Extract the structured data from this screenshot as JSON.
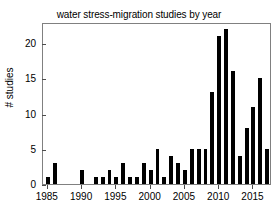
{
  "chart_data": {
    "type": "bar",
    "title": "water stress-migration studies by year",
    "xlabel": "",
    "ylabel": "# studies",
    "xlim": [
      1984.3,
      11
    ],
    "ylim": [
      0,
      23
    ],
    "grid": false,
    "legend": null,
    "bar_color": "#000000",
    "axis_color": "#808080",
    "categories": [
      1985,
      1986,
      1987,
      1988,
      1989,
      1990,
      1991,
      1992,
      1993,
      1994,
      1995,
      1996,
      1997,
      1998,
      1999,
      2000,
      2001,
      2002,
      2003,
      2004,
      2005,
      2006,
      2007,
      2008,
      2009,
      2010,
      2011,
      2012,
      2013,
      2014,
      2015,
      2016,
      2017
    ],
    "values": [
      1,
      3,
      0,
      0,
      0,
      2,
      0,
      1,
      1,
      2,
      1,
      3,
      1,
      1,
      3,
      2,
      5,
      1,
      4,
      3,
      2,
      5,
      5,
      5,
      13,
      21,
      22,
      16,
      4,
      8,
      11,
      15,
      5
    ],
    "yticks": [
      0,
      5,
      10,
      15,
      20
    ],
    "ytick_labels": [
      "0",
      "5",
      "10",
      "15",
      "20"
    ],
    "xticks": [
      1985,
      1990,
      1995,
      2000,
      2005,
      2010,
      2015
    ],
    "xtick_labels": [
      "1985",
      "1990",
      "1995",
      "2000",
      "2005",
      "2010",
      "2015"
    ]
  }
}
